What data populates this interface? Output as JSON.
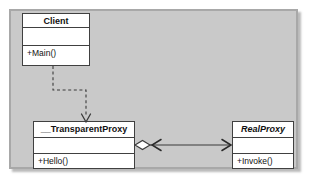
{
  "diagram": {
    "type": "uml-class-diagram",
    "canvas": {
      "background_color": "#c9c9c9",
      "border_color": "#a8a8a8"
    },
    "classes": [
      {
        "id": "client",
        "name": "Client",
        "stereotype": "",
        "abstract": false,
        "attributes": [],
        "operations": [
          "+Main()"
        ]
      },
      {
        "id": "transparentproxy",
        "name": "__TransparentProxy",
        "stereotype": "",
        "abstract": false,
        "attributes": [],
        "operations": [
          "+Hello()"
        ]
      },
      {
        "id": "realproxy",
        "name": "RealProxy",
        "stereotype": "",
        "abstract": true,
        "attributes": [],
        "operations": [
          "+Invoke()"
        ]
      }
    ],
    "relationships": [
      {
        "id": "client-to-transparentproxy",
        "kind": "dependency",
        "line_style": "dashed",
        "from": "Client",
        "to": "__TransparentProxy",
        "arrow_head": "open",
        "label": ""
      },
      {
        "id": "transparentproxy-to-realproxy",
        "kind": "aggregation",
        "line_style": "solid",
        "from": "__TransparentProxy",
        "to": "RealProxy",
        "diamond_end": "__TransparentProxy",
        "diamond_filled": false,
        "arrow_head": "open-both-ends",
        "label": ""
      }
    ],
    "line_color": "#3a3a3a",
    "class_fill_color": "#ffffff",
    "class_border_color": "#404040"
  }
}
